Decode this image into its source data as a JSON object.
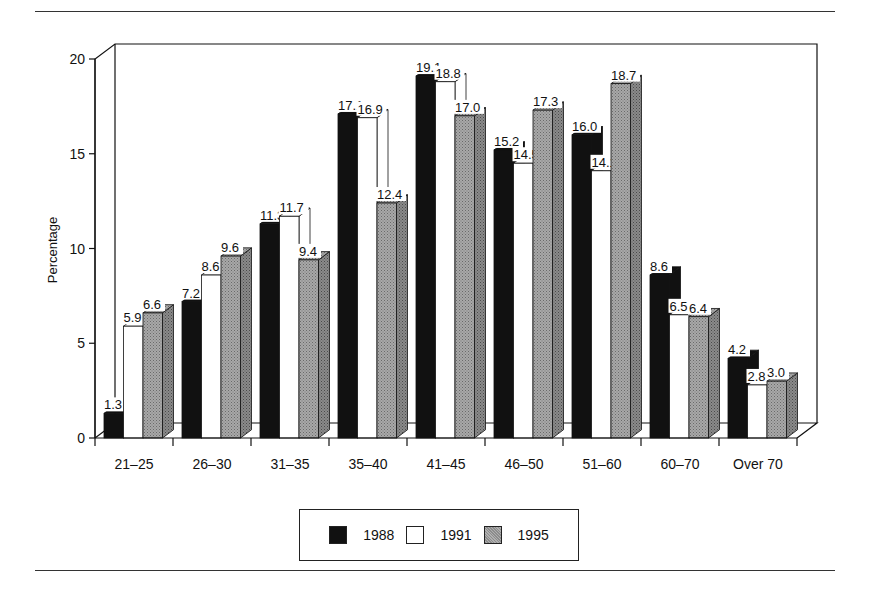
{
  "chart_data": {
    "type": "bar",
    "title": "",
    "xlabel": "",
    "ylabel": "Percentage",
    "ylim": [
      0,
      20
    ],
    "yticks": [
      0,
      5,
      10,
      15,
      20
    ],
    "grid": false,
    "legend_position": "bottom",
    "style": "3d clustered bars with value labels",
    "categories": [
      "21–25",
      "26–30",
      "31–35",
      "35–40",
      "41–45",
      "46–50",
      "51–60",
      "60–70",
      "Over 70"
    ],
    "series": [
      {
        "name": "1988",
        "color": "#111111",
        "values": [
          1.3,
          7.2,
          11.3,
          17.1,
          19.1,
          15.2,
          16.0,
          8.6,
          4.2
        ]
      },
      {
        "name": "1991",
        "color": "#ffffff",
        "values": [
          5.9,
          8.6,
          11.7,
          16.9,
          18.8,
          14.5,
          14.1,
          6.5,
          2.8
        ]
      },
      {
        "name": "1995",
        "color": "#9a9a9a",
        "values": [
          6.6,
          9.6,
          9.4,
          12.4,
          17.0,
          17.3,
          18.7,
          6.4,
          3.0
        ]
      }
    ]
  },
  "legend": {
    "items": [
      {
        "label": "1988",
        "color": "#111111"
      },
      {
        "label": "1991",
        "color": "#ffffff"
      },
      {
        "label": "1995",
        "color": "#9a9a9a"
      }
    ]
  }
}
